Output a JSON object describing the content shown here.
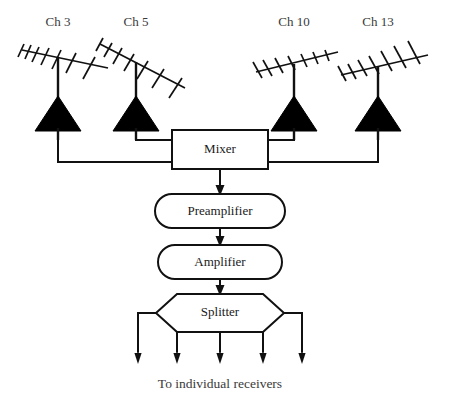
{
  "diagram": {
    "background_color": "#ffffff",
    "line_color": "#111111",
    "fill_color": "#000000",
    "antennas": [
      {
        "id": "ch3",
        "label": "Ch 3",
        "label_x": 58,
        "label_y": 26,
        "mast_x": 58,
        "boom_tilt": "up-right",
        "amp_cy": 120
      },
      {
        "id": "ch5",
        "label": "Ch 5",
        "label_x": 136,
        "label_y": 26,
        "mast_x": 136,
        "boom_tilt": "down-right",
        "amp_cy": 120
      },
      {
        "id": "ch10",
        "label": "Ch 10",
        "label_x": 294,
        "label_y": 26,
        "mast_x": 294,
        "boom_tilt": "up-right",
        "amp_cy": 120
      },
      {
        "id": "ch13",
        "label": "Ch 13",
        "label_x": 378,
        "label_y": 26,
        "mast_x": 378,
        "boom_tilt": "down-right",
        "amp_cy": 120
      }
    ],
    "stages": [
      {
        "id": "mixer",
        "label": "Mixer",
        "shape": "rect",
        "cx": 220,
        "cy": 149
      },
      {
        "id": "preamplifier",
        "label": "Preamplifier",
        "shape": "stadium",
        "cx": 220,
        "cy": 211
      },
      {
        "id": "amplifier",
        "label": "Amplifier",
        "shape": "stadium",
        "cx": 220,
        "cy": 262
      },
      {
        "id": "splitter",
        "label": "Splitter",
        "shape": "hexagon",
        "cx": 220,
        "cy": 313
      }
    ],
    "outputs": {
      "count": 5,
      "arrow_x": [
        161,
        190,
        220,
        250,
        280
      ],
      "arrow_tip_y": 362
    },
    "caption": "To individual receivers"
  }
}
